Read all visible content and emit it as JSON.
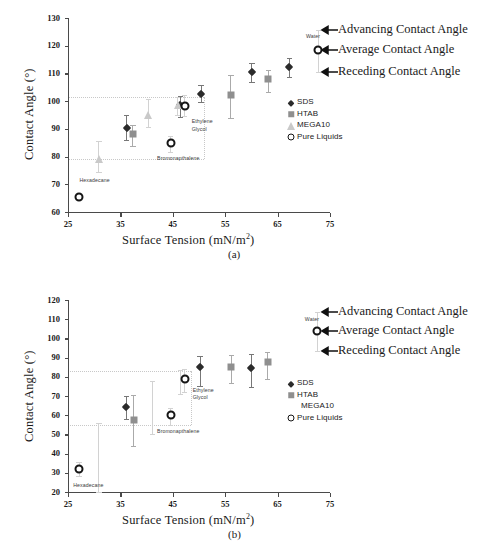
{
  "figure": {
    "panels": [
      {
        "caption": "(a)",
        "xlabel_main": "Surface Tension (mN/m",
        "xlabel_sup": "2",
        "xlabel_tail": ")",
        "ylabel": "Contact Angle (°)",
        "ylim": [
          60,
          130
        ],
        "yticks": [
          "60",
          "70",
          "80",
          "90",
          "100",
          "110",
          "120",
          "130"
        ],
        "xlim": [
          25,
          75
        ],
        "xticks": [
          "25",
          "35",
          "45",
          "55",
          "65",
          "75"
        ],
        "guides_y": [
          101.5,
          79.0
        ],
        "annotations": [
          {
            "text": "Advancing Contact Angle",
            "y": 125.5
          },
          {
            "text": "Average Contact Angle",
            "y": 118.3
          },
          {
            "text": "Receding Contact Angle",
            "y": 110.5
          }
        ],
        "legend": [
          {
            "label": "SDS",
            "symbol": "diamond"
          },
          {
            "label": "HTAB",
            "symbol": "square"
          },
          {
            "label": "MEGA10",
            "symbol": "triangle"
          },
          {
            "label": "Pure Liquids",
            "symbol": "circle"
          }
        ],
        "point_labels": [
          {
            "text": "Hexadecane",
            "x": 27.2,
            "y": 71.5
          },
          {
            "text": "Bromonapthalene",
            "x": 42.0,
            "y": 79.6
          },
          {
            "text": "Ethylene",
            "x": 48.6,
            "y": 93.0
          },
          {
            "text": "Glycol",
            "x": 48.6,
            "y": 90.0
          },
          {
            "text": "Water",
            "x": 70.4,
            "y": 123.6
          }
        ]
      },
      {
        "caption": "(b)",
        "xlabel_main": "Surface Tension (mN/m",
        "xlabel_sup": "2",
        "xlabel_tail": ")",
        "ylabel": "Contact Angle (°)",
        "ylim": [
          20,
          120
        ],
        "yticks": [
          "20",
          "30",
          "40",
          "50",
          "60",
          "70",
          "80",
          "90",
          "100",
          "110",
          "120"
        ],
        "xlim": [
          25,
          75
        ],
        "xticks": [
          "25",
          "35",
          "45",
          "55",
          "65",
          "75"
        ],
        "guides_y": [
          83.0,
          55.0
        ],
        "annotations": [
          {
            "text": "Advancing Contact Angle",
            "y": 113.5
          },
          {
            "text": "Average Contact Angle",
            "y": 104.0
          },
          {
            "text": "Receding Contact Angle",
            "y": 93.5
          }
        ],
        "legend": [
          {
            "label": "SDS",
            "symbol": "diamond"
          },
          {
            "label": "HTAB",
            "symbol": "square"
          },
          {
            "label": "MEGA10",
            "symbol": "none"
          },
          {
            "label": "Pure Liquids",
            "symbol": "circle"
          }
        ],
        "point_labels": [
          {
            "text": "Hexadecane",
            "x": 26.0,
            "y": 23.5
          },
          {
            "text": "Bromonapthalene",
            "x": 42.0,
            "y": 52.0
          },
          {
            "text": "Ethylene",
            "x": 48.8,
            "y": 73.0
          },
          {
            "text": "Glycol",
            "x": 48.8,
            "y": 69.6
          },
          {
            "text": "Water",
            "x": 70.2,
            "y": 110.0
          }
        ]
      }
    ]
  },
  "chart_data": [
    {
      "type": "scatter",
      "panel": "(a)",
      "title": "",
      "xlabel": "Surface Tension (mN/m2)",
      "ylabel": "Contact Angle (°)",
      "xlim": [
        25,
        75
      ],
      "ylim": [
        60,
        130
      ],
      "xticks": [
        25,
        35,
        45,
        55,
        65,
        75
      ],
      "yticks": [
        60,
        70,
        80,
        90,
        100,
        110,
        120,
        130
      ],
      "grid": false,
      "legend_position": "right-middle",
      "guide_lines_y": [
        101.5,
        79.0
      ],
      "error_bar_meaning": {
        "upper_cap": "Advancing Contact Angle",
        "marker": "Average Contact Angle",
        "lower_cap": "Receding Contact Angle"
      },
      "series": [
        {
          "name": "SDS",
          "marker": "diamond",
          "color": "#2b2b2b",
          "points": [
            {
              "x": 36.2,
              "y": 90.4,
              "y_high": 95.0,
              "y_low": 86.0
            },
            {
              "x": 46.4,
              "y": 98.6,
              "y_high": 101.8,
              "y_low": 94.3
            },
            {
              "x": 50.4,
              "y": 102.6,
              "y_high": 105.8,
              "y_low": 99.8
            },
            {
              "x": 60.1,
              "y": 110.6,
              "y_high": 113.6,
              "y_low": 106.9
            },
            {
              "x": 67.2,
              "y": 112.5,
              "y_high": 115.6,
              "y_low": 108.6
            }
          ]
        },
        {
          "name": "HTAB",
          "marker": "square",
          "color": "#8f8f8f",
          "points": [
            {
              "x": 37.4,
              "y": 88.0,
              "y_high": 91.5,
              "y_low": 83.7
            },
            {
              "x": 56.1,
              "y": 102.1,
              "y_high": 109.5,
              "y_low": 94.0
            },
            {
              "x": 63.2,
              "y": 108.0,
              "y_high": 111.3,
              "y_low": 103.3
            }
          ]
        },
        {
          "name": "MEGA10",
          "marker": "triangle",
          "color": "#c9c9c9",
          "points": [
            {
              "x": 30.9,
              "y": 79.2,
              "y_high": 85.5,
              "y_low": 74.4
            },
            {
              "x": 40.3,
              "y": 95.1,
              "y_high": 100.6,
              "y_low": 90.5
            },
            {
              "x": 45.9,
              "y": 98.6,
              "y_high": 101.4,
              "y_low": 95.0
            }
          ]
        },
        {
          "name": "Pure Liquids",
          "marker": "open-circle",
          "color": "#151515",
          "points": [
            {
              "x": 27.1,
              "y": 65.4,
              "y_high": 65.4,
              "y_low": 65.4,
              "label": "Hexadecane"
            },
            {
              "x": 44.6,
              "y": 84.8,
              "y_high": 87.4,
              "y_low": 81.7,
              "label": "Bromonapthalene"
            },
            {
              "x": 47.3,
              "y": 98.4,
              "y_high": 102.2,
              "y_low": 94.5,
              "label": "Ethylene Glycol"
            },
            {
              "x": 72.8,
              "y": 118.3,
              "y_high": 125.8,
              "y_low": 110.6,
              "label": "Water"
            }
          ]
        }
      ]
    },
    {
      "type": "scatter",
      "panel": "(b)",
      "title": "",
      "xlabel": "Surface Tension (mN/m2)",
      "ylabel": "Contact Angle (°)",
      "xlim": [
        25,
        75
      ],
      "ylim": [
        20,
        120
      ],
      "xticks": [
        25,
        35,
        45,
        55,
        65,
        75
      ],
      "yticks": [
        20,
        30,
        40,
        50,
        60,
        70,
        80,
        90,
        100,
        110,
        120
      ],
      "grid": false,
      "legend_position": "right-middle",
      "guide_lines_y": [
        83.0,
        55.0
      ],
      "error_bar_meaning": {
        "upper_cap": "Advancing Contact Angle",
        "marker": "Average Contact Angle",
        "lower_cap": "Receding Contact Angle"
      },
      "series": [
        {
          "name": "SDS",
          "marker": "diamond",
          "color": "#2b2b2b",
          "points": [
            {
              "x": 36.1,
              "y": 64.3,
              "y_high": 70.0,
              "y_low": 57.8
            },
            {
              "x": 50.2,
              "y": 85.0,
              "y_high": 91.0,
              "y_low": 75.0
            },
            {
              "x": 60.0,
              "y": 84.5,
              "y_high": 92.0,
              "y_low": 74.5
            }
          ]
        },
        {
          "name": "HTAB",
          "marker": "square",
          "color": "#8f8f8f",
          "points": [
            {
              "x": 37.5,
              "y": 57.5,
              "y_high": 70.7,
              "y_low": 44.0
            },
            {
              "x": 56.2,
              "y": 85.1,
              "y_high": 91.5,
              "y_low": 77.0
            },
            {
              "x": 63.1,
              "y": 87.5,
              "y_high": 93.0,
              "y_low": 78.8
            }
          ]
        },
        {
          "name": "MEGA10",
          "marker": "none",
          "color": "#c9c9c9",
          "points": [
            {
              "x": 30.9,
              "y": 37.0,
              "y_high": 56.0,
              "y_low": 20.0
            },
            {
              "x": 41.2,
              "y": 64.0,
              "y_high": 78.0,
              "y_low": 50.0
            },
            {
              "x": 46.4,
              "y": 78.5,
              "y_high": 83.5,
              "y_low": 71.0
            }
          ]
        },
        {
          "name": "Pure Liquids",
          "marker": "open-circle",
          "color": "#151515",
          "points": [
            {
              "x": 27.1,
              "y": 32.0,
              "y_high": 35.5,
              "y_low": 28.5,
              "label": "Hexadecane"
            },
            {
              "x": 44.6,
              "y": 60.2,
              "y_high": 64.0,
              "y_low": 55.0,
              "label": "Bromonapthalene"
            },
            {
              "x": 47.3,
              "y": 78.8,
              "y_high": 84.0,
              "y_low": 72.0,
              "label": "Ethylene Glycol"
            },
            {
              "x": 72.6,
              "y": 104.0,
              "y_high": 113.5,
              "y_low": 93.5,
              "label": "Water"
            }
          ]
        }
      ]
    }
  ]
}
